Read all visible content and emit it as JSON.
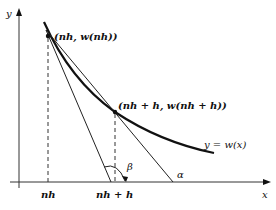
{
  "diagram": {
    "axes": {
      "x_label": "x",
      "y_label": "y"
    },
    "curve_label": "y = w(x)",
    "points": [
      {
        "label": "(nh, w(nh))"
      },
      {
        "label": "(nh + h, w(nh + h))"
      }
    ],
    "x_ticks": [
      {
        "label": "nh"
      },
      {
        "label": "nh + h"
      }
    ],
    "angles": [
      {
        "label": "β"
      },
      {
        "label": "α"
      }
    ],
    "colors": {
      "line": "#111111",
      "background": "#ffffff"
    }
  }
}
